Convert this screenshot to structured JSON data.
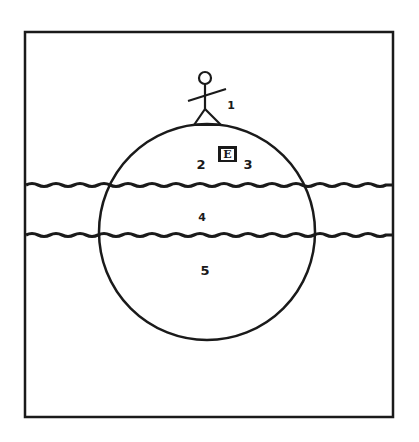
{
  "diagram": {
    "type": "layered-sphere-with-figure",
    "frame": {
      "x": 25,
      "y": 32,
      "width": 368,
      "height": 385
    },
    "circle": {
      "cx": 207,
      "cy": 232,
      "r": 108
    },
    "wavy_lines": [
      {
        "y": 185
      },
      {
        "y": 235
      }
    ],
    "colors": {
      "ink": "#1a1a1a",
      "background": "#ffffff"
    },
    "labels": [
      {
        "id": "1",
        "text": "1",
        "x": 231,
        "y": 105
      },
      {
        "id": "2",
        "text": "2",
        "x": 201,
        "y": 164
      },
      {
        "id": "3",
        "text": "3",
        "x": 248,
        "y": 164
      },
      {
        "id": "4",
        "text": "4",
        "x": 202,
        "y": 217
      },
      {
        "id": "5",
        "text": "5",
        "x": 205,
        "y": 270
      }
    ],
    "e_box": {
      "text": "E",
      "x": 218,
      "y": 146,
      "width": 19,
      "height": 16
    }
  }
}
